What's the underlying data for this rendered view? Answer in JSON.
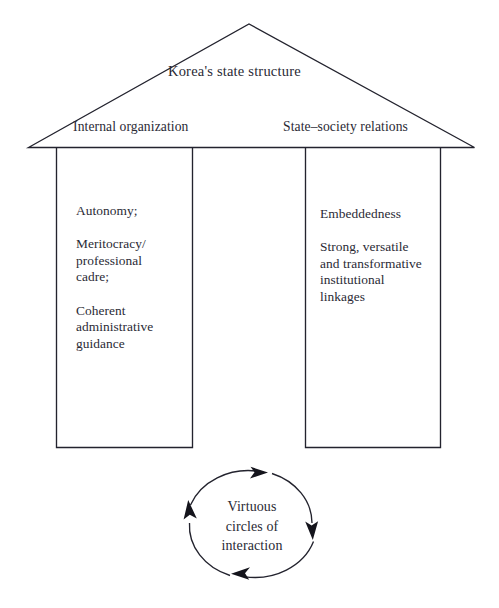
{
  "figure": {
    "type": "diagram",
    "shape": "house-with-two-pillars-and-feedback-loop",
    "roof": {
      "title": "Korea's state structure",
      "left_label": "Internal organization",
      "right_label": "State–society relations"
    },
    "columns": [
      {
        "id": "internal-organization",
        "text": "Autonomy;\n\nMeritocracy/\nprofessional\ncadre;\n\nCoherent\nadministrative\nguidance"
      },
      {
        "id": "state-society-relations",
        "text": "Embeddedness\n\nStrong, versatile\nand transformative\ninstitutional\nlinkages"
      }
    ],
    "loop": {
      "label": "Virtuous\ncircles of\ninteraction",
      "arrow_count": 4,
      "direction": "clockwise"
    },
    "colors": {
      "stroke": "#23232e",
      "text": "#2a2a35",
      "background": "#ffffff"
    }
  }
}
